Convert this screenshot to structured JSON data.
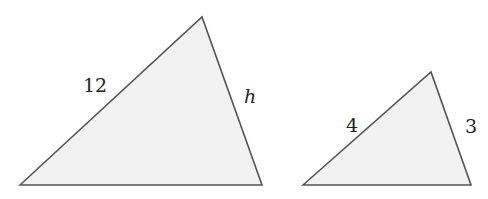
{
  "figure": {
    "triangles": [
      {
        "id": "large",
        "vertices": [
          [
            20,
            185
          ],
          [
            202,
            17
          ],
          [
            262,
            185
          ]
        ],
        "labels": [
          {
            "text": "12",
            "side": "left",
            "x": 83,
            "y": 92,
            "italic": false
          },
          {
            "text": "h",
            "side": "right",
            "x": 244,
            "y": 103,
            "italic": true
          }
        ]
      },
      {
        "id": "small",
        "vertices": [
          [
            303,
            185
          ],
          [
            431,
            72
          ],
          [
            471,
            185
          ]
        ],
        "labels": [
          {
            "text": "4",
            "side": "left",
            "x": 346,
            "y": 132,
            "italic": false
          },
          {
            "text": "3",
            "side": "right",
            "x": 465,
            "y": 133,
            "italic": false
          }
        ]
      }
    ],
    "fill_color": "#f2f2f2",
    "stroke_color": "#555555"
  }
}
